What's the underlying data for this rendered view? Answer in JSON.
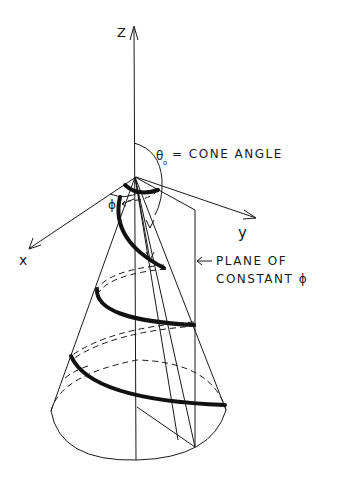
{
  "diagram": {
    "axes": {
      "z_label": "Z",
      "y_label": "y",
      "x_label": "x"
    },
    "annotations": {
      "cone_angle": "θ₀ = CONE ANGLE",
      "cone_angle_symbol": "θ",
      "cone_angle_subscript": "o",
      "cone_angle_text": "= CONE ANGLE",
      "phi_label": "ϕ",
      "plane_line1": "PLANE OF",
      "plane_line2": "CONSTANT ϕ"
    },
    "colors": {
      "ink": "#1a1a1a",
      "background": "#ffffff"
    }
  }
}
